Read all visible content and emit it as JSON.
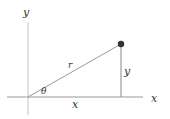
{
  "diagram": {
    "type": "polar-coordinates",
    "labels": {
      "y_axis": "y",
      "x_axis": "x",
      "radius": "r",
      "angle": "θ",
      "x_leg": "x",
      "y_leg": "y"
    },
    "geometry": {
      "origin": [
        28,
        97
      ],
      "point": [
        121,
        44
      ],
      "x_axis_range": [
        7,
        143
      ],
      "y_axis_range": [
        22,
        115
      ]
    },
    "colors": {
      "axis": "#bbbbbb",
      "line": "#999999",
      "point": "#333333",
      "text": "#333333"
    }
  }
}
